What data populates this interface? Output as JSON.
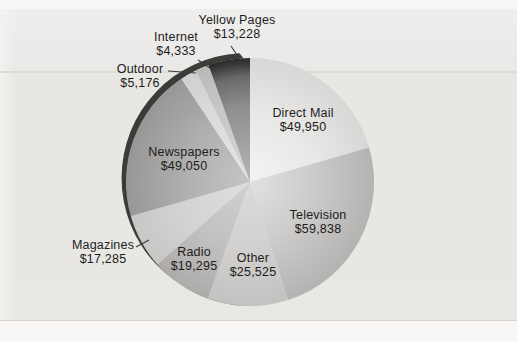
{
  "chart_data": {
    "type": "pie",
    "title": "",
    "legend": "none (direct slice labels with leader lines)",
    "direction": "clockwise",
    "start_angle_deg": 0,
    "total": 243680,
    "slices": [
      {
        "label": "Direct Mail",
        "value": 49950,
        "value_label": "$49,950",
        "gradient": [
          [
            0,
            "#f4f3f1"
          ],
          [
            0.55,
            "#e9e8e6"
          ],
          [
            1,
            "#d8d7d5"
          ]
        ]
      },
      {
        "label": "Television",
        "value": 59838,
        "value_label": "$59,838",
        "gradient": [
          [
            0,
            "#e2e1df"
          ],
          [
            0.45,
            "#cfcecc"
          ],
          [
            1,
            "#b4b3b1"
          ]
        ]
      },
      {
        "label": "Other",
        "value": 25525,
        "value_label": "$25,525",
        "gradient": [
          [
            0,
            "#dcdbd9"
          ],
          [
            0.6,
            "#d0cfcd"
          ],
          [
            1,
            "#c3c2c0"
          ]
        ]
      },
      {
        "label": "Radio",
        "value": 19295,
        "value_label": "$19,295",
        "gradient": [
          [
            0,
            "#d2d1cf"
          ],
          [
            0.55,
            "#c2c1bf"
          ],
          [
            1,
            "#adacaa"
          ]
        ]
      },
      {
        "label": "Magazines",
        "value": 17285,
        "value_label": "$17,285",
        "gradient": [
          [
            0,
            "#e0dfdd"
          ],
          [
            0.55,
            "#d5d4d2"
          ],
          [
            1,
            "#c8c7c5"
          ]
        ]
      },
      {
        "label": "Newspapers",
        "value": 49050,
        "value_label": "$49,050",
        "gradient": [
          [
            0,
            "#c6c5c3"
          ],
          [
            0.5,
            "#b2b1af"
          ],
          [
            1,
            "#989795"
          ]
        ]
      },
      {
        "label": "Outdoor",
        "value": 5176,
        "value_label": "$5,176",
        "gradient": [
          [
            0,
            "#e7e6e4"
          ],
          [
            0.6,
            "#dcdbd9"
          ],
          [
            1,
            "#d0cfcd"
          ]
        ]
      },
      {
        "label": "Internet",
        "value": 4333,
        "value_label": "$4,333",
        "gradient": [
          [
            0,
            "#d7d6d4"
          ],
          [
            0.6,
            "#c9c8c6"
          ],
          [
            1,
            "#bab9b7"
          ]
        ]
      },
      {
        "label": "Yellow Pages",
        "value": 13228,
        "value_label": "$13,228",
        "gradient": [
          [
            0,
            "#b5b4b2"
          ],
          [
            0.6,
            "#91908e"
          ],
          [
            0.85,
            "#6b6a68"
          ],
          [
            0.955,
            "#3a3938"
          ],
          [
            1,
            "#2b2a28"
          ]
        ]
      }
    ]
  },
  "colors": {
    "page": "#f8f7f5",
    "band": "#e9e7e4",
    "rule_line": "#dbd8d4",
    "shadow": "#2d2c2a",
    "leader": "#3a3a3a",
    "text": "#1c1c1c"
  }
}
